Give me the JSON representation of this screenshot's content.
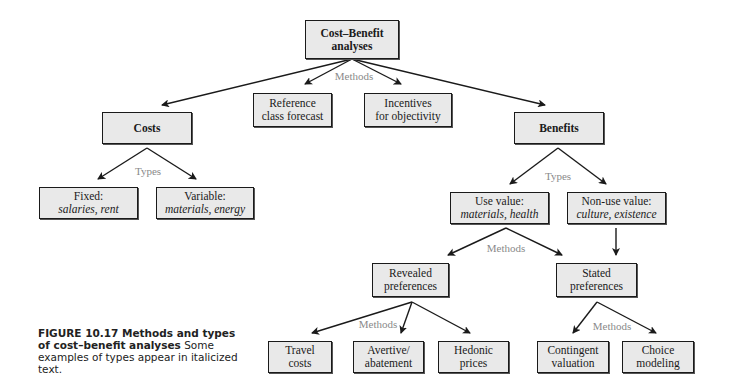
{
  "nodes": {
    "root": {
      "line1": "Cost–Benefit",
      "line2": "analyses"
    },
    "reference": {
      "line1": "Reference",
      "line2": "class forecast"
    },
    "incentives": {
      "line1": "Incentives",
      "line2": "for objectivity"
    },
    "costs": {
      "line1": "Costs"
    },
    "benefits": {
      "line1": "Benefits"
    },
    "fixed": {
      "line1": "Fixed:",
      "line2": "salaries, rent"
    },
    "variable": {
      "line1": "Variable:",
      "line2": "materials, energy"
    },
    "use_value": {
      "line1": "Use value:",
      "line2": "materials, health"
    },
    "non_use_value": {
      "line1": "Non-use value:",
      "line2": "culture, existence"
    },
    "revealed": {
      "line1": "Revealed",
      "line2": "preferences"
    },
    "stated": {
      "line1": "Stated",
      "line2": "preferences"
    },
    "travel": {
      "line1": "Travel",
      "line2": "costs"
    },
    "avertive": {
      "line1": "Avertive/",
      "line2": "abatement"
    },
    "hedonic": {
      "line1": "Hedonic",
      "line2": "prices"
    },
    "contingent": {
      "line1": "Contingent",
      "line2": "valuation"
    },
    "choice": {
      "line1": "Choice",
      "line2": "modeling"
    }
  },
  "edge_labels": {
    "root_methods": "Methods",
    "costs_types": "Types",
    "benefits_types": "Types",
    "use_methods": "Methods",
    "revealed_methods": "Methods",
    "stated_methods": "Methods"
  },
  "caption": {
    "title": "FIGURE 10.17   Methods and types of cost–benefit analyses",
    "body": " Some examples of types appear in italicized text."
  },
  "colors": {
    "box_fill": "#e9e9e9",
    "box_border": "#1a1a1a",
    "edge_label": "#8a8a8a",
    "arrow": "#1a1a1a"
  }
}
